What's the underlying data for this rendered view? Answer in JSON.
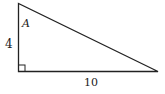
{
  "diagram": {
    "type": "right-triangle",
    "vertices": {
      "top": [
        18.5,
        3.5
      ],
      "right_angle": [
        18.5,
        71.5
      ],
      "right": [
        158,
        71.5
      ]
    },
    "labels": {
      "angle": "A",
      "vertical_side": "4",
      "horizontal_side": "10"
    },
    "right_angle_marker": true,
    "stroke_color": "#222222"
  }
}
